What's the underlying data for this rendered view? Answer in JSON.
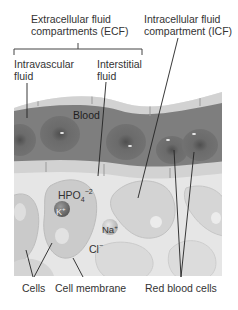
{
  "labels": {
    "ecf_line1": "Extracellular fluid",
    "ecf_line2": "compartments (ECF)",
    "icf_line1": "Intracellular fluid",
    "icf_line2": "compartment (ICF)",
    "intravascular_line1": "Intravascular",
    "intravascular_line2": "fluid",
    "interstitial_line1": "Interstitial",
    "interstitial_line2": "fluid",
    "blood": "Blood",
    "cells": "Cells",
    "cell_membrane": "Cell membrane",
    "red_blood_cells": "Red blood cells"
  },
  "ions": {
    "hpo4": {
      "base": "HPO",
      "sub": "4",
      "sup": "−2"
    },
    "k": {
      "base": "K",
      "sup": "+"
    },
    "na": {
      "base": "Na",
      "sup": "+"
    },
    "cl": {
      "base": "Cl",
      "sup": "−"
    }
  },
  "colors": {
    "vessel_wall": "#cfcfcf",
    "blood": "#7d7d7d",
    "rbc": "#6a6a6a",
    "interstitial": "#e4e4e4",
    "cell": "#c9c9c9",
    "k_ion": "#6f6f6f",
    "na_ion": "#bdbdbd"
  }
}
